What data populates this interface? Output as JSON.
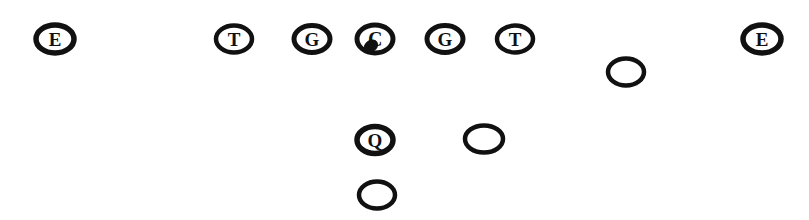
{
  "diagram": {
    "width": 809,
    "height": 220,
    "background_color": "#ffffff",
    "marker_color": "#111111",
    "line_of_scrimmage_y": 39
  },
  "legend": {
    "E": "End",
    "T": "Tackle",
    "G": "Guard",
    "C": "Center",
    "Q": "Quarterback",
    "blank": "Back"
  },
  "players": [
    {
      "id": "left-end",
      "label": "E",
      "position_name": "end",
      "x": 55,
      "y": 39,
      "rx": 19,
      "ry": 14,
      "stroke": 5.5,
      "lettered": true,
      "has_ball": false
    },
    {
      "id": "left-tackle",
      "label": "T",
      "position_name": "tackle",
      "x": 234,
      "y": 39,
      "rx": 18,
      "ry": 13.5,
      "stroke": 4.5,
      "lettered": true,
      "has_ball": false
    },
    {
      "id": "left-guard",
      "label": "G",
      "position_name": "guard",
      "x": 312,
      "y": 39,
      "rx": 18,
      "ry": 13.5,
      "stroke": 5,
      "lettered": true,
      "has_ball": false
    },
    {
      "id": "center",
      "label": "C",
      "position_name": "center",
      "x": 375,
      "y": 39,
      "rx": 18,
      "ry": 14,
      "stroke": 5,
      "lettered": true,
      "has_ball": true
    },
    {
      "id": "right-guard",
      "label": "G",
      "position_name": "guard",
      "x": 445,
      "y": 39,
      "rx": 18,
      "ry": 13.5,
      "stroke": 5,
      "lettered": true,
      "has_ball": false
    },
    {
      "id": "right-tackle",
      "label": "T",
      "position_name": "tackle",
      "x": 515,
      "y": 39,
      "rx": 18,
      "ry": 13.5,
      "stroke": 4.5,
      "lettered": true,
      "has_ball": false
    },
    {
      "id": "right-wing-back",
      "label": "",
      "position_name": "back",
      "x": 626,
      "y": 72,
      "rx": 18,
      "ry": 13.5,
      "stroke": 4.5,
      "lettered": false,
      "has_ball": false
    },
    {
      "id": "right-end",
      "label": "E",
      "position_name": "end",
      "x": 762,
      "y": 39,
      "rx": 19,
      "ry": 14,
      "stroke": 5.5,
      "lettered": true,
      "has_ball": false
    },
    {
      "id": "quarterback",
      "label": "Q",
      "position_name": "quarterback",
      "x": 375,
      "y": 140,
      "rx": 18,
      "ry": 13.5,
      "stroke": 5.5,
      "lettered": true,
      "has_ball": false
    },
    {
      "id": "right-half-back",
      "label": "",
      "position_name": "back",
      "x": 484,
      "y": 139,
      "rx": 19,
      "ry": 13.5,
      "stroke": 4.5,
      "lettered": false,
      "has_ball": false
    },
    {
      "id": "full-back",
      "label": "",
      "position_name": "back",
      "x": 377,
      "y": 195,
      "rx": 18,
      "ry": 13.5,
      "stroke": 4.5,
      "lettered": false,
      "has_ball": false
    }
  ],
  "ball": {
    "id": "football",
    "offset_x": -4,
    "offset_y": 7,
    "width": 15,
    "height": 12
  }
}
